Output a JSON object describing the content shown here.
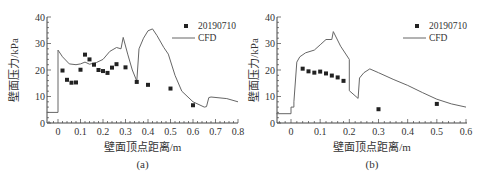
{
  "chart_data": [
    {
      "type": "line+scatter",
      "panel_label": "(a)",
      "xlabel": "壁面顶点距离/m",
      "ylabel": "壁面压力/kPa",
      "xlim": [
        -0.05,
        0.8
      ],
      "ylim": [
        0,
        40
      ],
      "xticks": [
        "0",
        "0.1",
        "0.2",
        "0.3",
        "0.4",
        "0.5",
        "0.6",
        "0.7",
        "0.8"
      ],
      "yticks": [
        "0",
        "10",
        "20",
        "30",
        "40"
      ],
      "legend": {
        "position": "upper right",
        "entries": [
          "20190710",
          "CFD"
        ]
      },
      "series": [
        {
          "name": "20190710",
          "kind": "scatter",
          "x": [
            0.02,
            0.04,
            0.06,
            0.08,
            0.1,
            0.12,
            0.14,
            0.16,
            0.18,
            0.2,
            0.22,
            0.24,
            0.26,
            0.3,
            0.35,
            0.4,
            0.5,
            0.6
          ],
          "y": [
            19.8,
            16.3,
            15.2,
            15.3,
            20.1,
            25.8,
            24.0,
            22.0,
            20.0,
            19.6,
            18.9,
            20.9,
            22.2,
            21.0,
            15.5,
            14.4,
            13.0,
            6.7
          ]
        },
        {
          "name": "CFD",
          "kind": "line",
          "x": [
            -0.05,
            0.0,
            0.0,
            0.02,
            0.05,
            0.08,
            0.1,
            0.12,
            0.14,
            0.17,
            0.2,
            0.23,
            0.26,
            0.28,
            0.29,
            0.31,
            0.33,
            0.35,
            0.36,
            0.38,
            0.4,
            0.42,
            0.44,
            0.47,
            0.49,
            0.52,
            0.55,
            0.6,
            0.65,
            0.66,
            0.67,
            0.68,
            0.75,
            0.8
          ],
          "y": [
            4,
            4,
            27.5,
            25,
            22.3,
            22,
            22.3,
            23,
            22.2,
            22.8,
            24,
            27,
            28.5,
            28,
            32.3,
            26,
            20,
            15.8,
            28,
            32,
            34.8,
            35.5,
            33,
            28.5,
            26,
            18,
            12,
            8,
            6,
            6.2,
            9.6,
            9.8,
            9.2,
            8
          ]
        }
      ]
    },
    {
      "type": "line+scatter",
      "panel_label": "(b)",
      "xlabel": "壁面顶点距离/m",
      "ylabel": "壁面压力/kPa",
      "xlim": [
        -0.05,
        0.6
      ],
      "ylim": [
        0,
        40
      ],
      "xticks": [
        "0",
        "0.1",
        "0.2",
        "0.3",
        "0.4",
        "0.5",
        "0.6"
      ],
      "yticks": [
        "0",
        "10",
        "20",
        "30",
        "40"
      ],
      "legend": {
        "position": "upper right",
        "entries": [
          "20190710",
          "CFD"
        ]
      },
      "series": [
        {
          "name": "20190710",
          "kind": "scatter",
          "x": [
            0.04,
            0.06,
            0.08,
            0.1,
            0.12,
            0.14,
            0.16,
            0.18,
            0.3,
            0.5
          ],
          "y": [
            20.5,
            19.5,
            19.0,
            19.4,
            18.7,
            17.9,
            17.2,
            15.9,
            5.2,
            7.2
          ]
        },
        {
          "name": "CFD",
          "kind": "line",
          "x": [
            -0.05,
            0.0,
            0.0,
            0.01,
            0.01,
            0.02,
            0.03,
            0.05,
            0.08,
            0.1,
            0.12,
            0.14,
            0.145,
            0.17,
            0.2,
            0.2,
            0.23,
            0.235,
            0.25,
            0.27,
            0.3,
            0.35,
            0.4,
            0.45,
            0.5,
            0.55,
            0.6
          ],
          "y": [
            3.5,
            3.5,
            6,
            6,
            8,
            23,
            25,
            26.5,
            27.5,
            29.5,
            31.5,
            31.5,
            34.5,
            29,
            24,
            12.2,
            9.3,
            17,
            19,
            20.4,
            19,
            16.5,
            14.2,
            11.5,
            9,
            7.2,
            6
          ]
        }
      ]
    }
  ],
  "labels": {
    "a": {
      "xlabel": "壁面顶点距离/m",
      "ylabel": "壁面压力/kPa",
      "panel": "(a)",
      "legend_scatter": "20190710",
      "legend_line": "CFD"
    },
    "b": {
      "xlabel": "壁面顶点距离/m",
      "ylabel": "壁面压力/kPa",
      "panel": "(b)",
      "legend_scatter": "20190710",
      "legend_line": "CFD"
    }
  },
  "colors": {
    "axis": "#444444",
    "line": "#666666",
    "marker": "#222222",
    "text": "#333333"
  }
}
